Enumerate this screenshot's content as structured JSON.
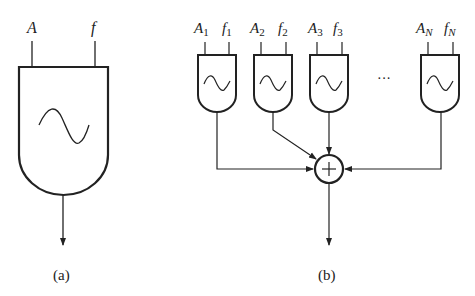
{
  "panel_a": {
    "caption": "(a)",
    "input_amplitude": "A",
    "input_frequency": "f",
    "block": "oscillator",
    "symbol": "sine-wave"
  },
  "panel_b": {
    "caption": "(b)",
    "oscillators": [
      {
        "amp": "A",
        "amp_sub": "1",
        "freq": "f",
        "freq_sub": "1"
      },
      {
        "amp": "A",
        "amp_sub": "2",
        "freq": "f",
        "freq_sub": "2"
      },
      {
        "amp": "A",
        "amp_sub": "3",
        "freq": "f",
        "freq_sub": "3"
      },
      {
        "amp": "A",
        "amp_sub": "N",
        "freq": "f",
        "freq_sub": "N"
      }
    ],
    "ellipsis": "···",
    "adder_symbol": "+"
  },
  "colors": {
    "ink": "#222222",
    "background": "#ffffff"
  }
}
